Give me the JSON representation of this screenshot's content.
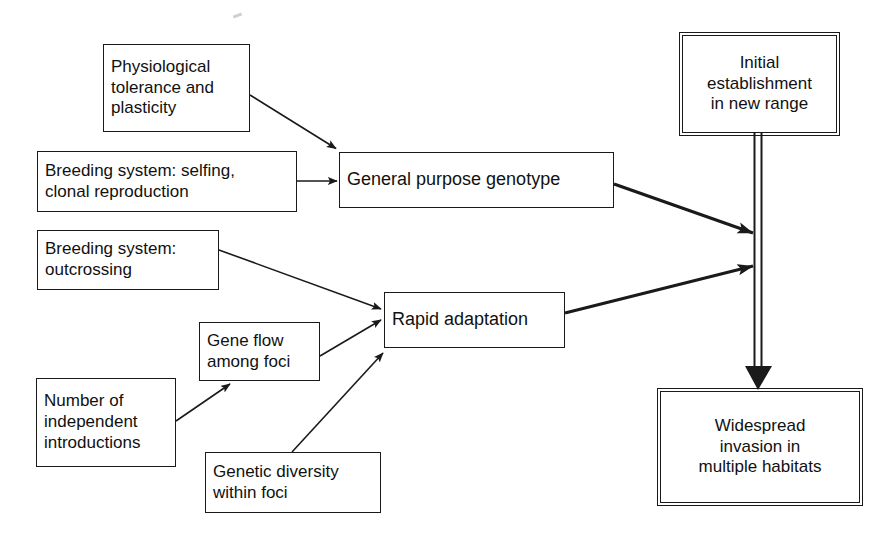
{
  "diagram": {
    "background_color": "#ffffff",
    "line_color": "#1a1a1a",
    "nodes": [
      {
        "id": "physiological-tolerance",
        "label": "Physiological\ntolerance and\nplasticity",
        "x": 103,
        "y": 44,
        "w": 147,
        "h": 88,
        "font_size": 17,
        "align": "left",
        "emphasis": false
      },
      {
        "id": "breeding-selfing",
        "label": "Breeding system: selfing,\nclonal reproduction",
        "x": 37,
        "y": 151,
        "w": 260,
        "h": 61,
        "font_size": 17,
        "align": "left",
        "emphasis": false
      },
      {
        "id": "breeding-outcrossing",
        "label": "Breeding system:\noutcrossing",
        "x": 37,
        "y": 230,
        "w": 182,
        "h": 60,
        "font_size": 17,
        "align": "left",
        "emphasis": false
      },
      {
        "id": "gene-flow",
        "label": "Gene flow\namong foci",
        "x": 199,
        "y": 322,
        "w": 121,
        "h": 59,
        "font_size": 17,
        "align": "left",
        "emphasis": false
      },
      {
        "id": "number-introductions",
        "label": "Number of\nindependent\nintroductions",
        "x": 36,
        "y": 378,
        "w": 140,
        "h": 89,
        "font_size": 17,
        "align": "left",
        "emphasis": false
      },
      {
        "id": "genetic-diversity",
        "label": "Genetic diversity\nwithin foci",
        "x": 205,
        "y": 452,
        "w": 176,
        "h": 61,
        "font_size": 17,
        "align": "left",
        "emphasis": false
      },
      {
        "id": "general-purpose-genotype",
        "label": "General purpose genotype",
        "x": 339,
        "y": 152,
        "w": 275,
        "h": 56,
        "font_size": 18,
        "align": "left",
        "emphasis": false
      },
      {
        "id": "rapid-adaptation",
        "label": "Rapid adaptation",
        "x": 384,
        "y": 292,
        "w": 181,
        "h": 56,
        "font_size": 18,
        "align": "left",
        "emphasis": false
      },
      {
        "id": "initial-establishment",
        "label": "Initial\nestablishment\nin new range",
        "x": 682,
        "y": 35,
        "w": 155,
        "h": 98,
        "font_size": 17,
        "align": "center",
        "emphasis": true
      },
      {
        "id": "widespread-invasion",
        "label": "Widespread\ninvasion in\nmultiple habitats",
        "x": 660,
        "y": 391,
        "w": 200,
        "h": 112,
        "font_size": 17,
        "align": "center",
        "emphasis": true
      }
    ],
    "edges": [
      {
        "id": "edge-physiological-to-gpg",
        "from": "physiological-tolerance",
        "to": "general-purpose-genotype",
        "style": "thin",
        "points": "250,95 336,148"
      },
      {
        "id": "edge-selfing-to-gpg",
        "from": "breeding-selfing",
        "to": "general-purpose-genotype",
        "style": "thin",
        "points": "297,181 334,181"
      },
      {
        "id": "edge-outcrossing-to-rapid",
        "from": "breeding-outcrossing",
        "to": "rapid-adaptation",
        "style": "thin",
        "points": "219,250 380,309"
      },
      {
        "id": "edge-geneflow-to-rapid",
        "from": "gene-flow",
        "to": "rapid-adaptation",
        "style": "thin",
        "points": "320,355 380,321"
      },
      {
        "id": "edge-introductions-to-geneflow",
        "from": "number-introductions",
        "to": "gene-flow",
        "style": "thin",
        "points": "176,420 196,381"
      },
      {
        "id": "edge-diversity-to-rapid",
        "from": "genetic-diversity",
        "to": "rapid-adaptation",
        "style": "thin",
        "points": "293,452 382,353"
      },
      {
        "id": "edge-gpg-to-trunk",
        "from": "general-purpose-genotype",
        "to": "establishment-invasion-trunk",
        "style": "thick",
        "points": "614,184 751,232"
      },
      {
        "id": "edge-rapid-to-trunk",
        "from": "rapid-adaptation",
        "to": "establishment-invasion-trunk",
        "style": "thick",
        "points": "565,313 751,265"
      },
      {
        "id": "edge-establishment-to-invasion",
        "from": "initial-establishment",
        "to": "widespread-invasion",
        "style": "double-outline",
        "points": "758,133 758,390"
      }
    ]
  }
}
